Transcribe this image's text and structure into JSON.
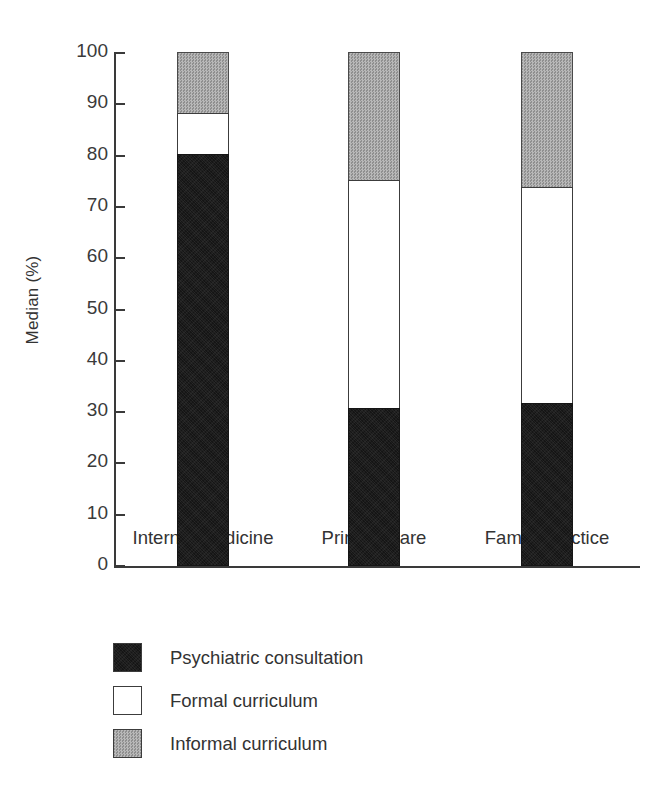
{
  "chart_data": {
    "type": "bar",
    "subtype": "stacked-bar",
    "title": "",
    "xlabel": "",
    "ylabel": "Median (%)",
    "ylim": [
      0,
      100
    ],
    "ytick_labels": [
      "100",
      "90",
      "80",
      "70",
      "60",
      "50",
      "40",
      "30",
      "20",
      "10",
      "0"
    ],
    "ytick_values": [
      100,
      90,
      80,
      70,
      60,
      50,
      40,
      30,
      20,
      10,
      0
    ],
    "grid": false,
    "legend_position": "below-left",
    "categories": [
      "Internal medicine",
      "Primary care",
      "Family practice"
    ],
    "series": [
      {
        "name": "Psychiatric consultation",
        "color": "#151515",
        "fill": "solid-black",
        "values": [
          80,
          30.5,
          31.5
        ]
      },
      {
        "name": "Formal curriculum",
        "color": "#ffffff",
        "fill": "white",
        "values": [
          8,
          44.5,
          42
        ]
      },
      {
        "name": "Informal curriculum",
        "color": "#a3a3a3",
        "fill": "gray-dither",
        "values": [
          12,
          25,
          26.5
        ]
      }
    ],
    "cumulative_tops": {
      "Internal medicine": [
        80,
        88,
        100
      ],
      "Primary care": [
        30.5,
        75,
        100
      ],
      "Family practice": [
        31.5,
        73.5,
        100
      ]
    },
    "annotations": []
  },
  "legend": {
    "items": [
      {
        "label": "Psychiatric consultation",
        "swatch": "black-swatch"
      },
      {
        "label": "Formal curriculum",
        "swatch": "white-swatch"
      },
      {
        "label": "Informal curriculum",
        "swatch": "gray-swatch"
      }
    ]
  },
  "axis": {
    "y_title": "Median (%)"
  }
}
